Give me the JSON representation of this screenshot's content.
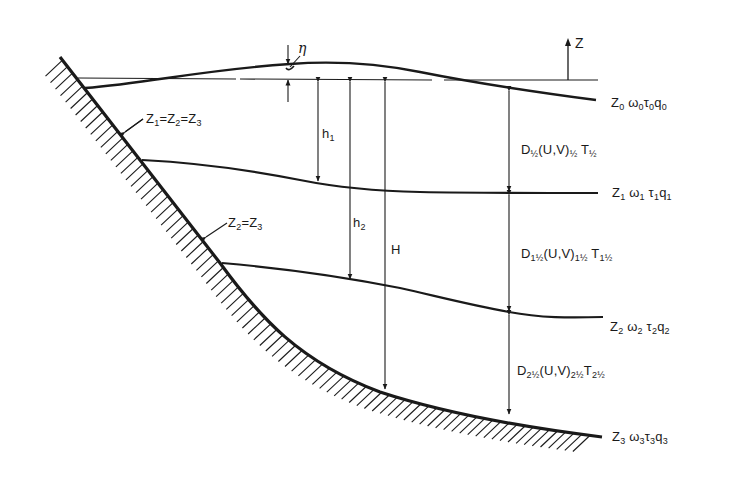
{
  "figure": {
    "colors": {
      "ink": "#1a1a1a",
      "background": "#ffffff"
    }
  },
  "labels": {
    "eta": "η",
    "z_axis": "Z",
    "bank_intersection_1": {
      "base": "Z",
      "parts": [
        [
          "Z",
          "1"
        ],
        [
          "Z",
          "2"
        ],
        [
          "Z",
          "3"
        ]
      ],
      "text": "Z1=Z2=Z3"
    },
    "bank_intersection_2": {
      "parts": [
        [
          "Z",
          "2"
        ],
        [
          "Z",
          "3"
        ]
      ],
      "text": "Z2=Z3"
    },
    "h1": {
      "base": "h",
      "sub": "1"
    },
    "h2": {
      "base": "h",
      "sub": "2"
    },
    "H": "H",
    "level_0": {
      "text": "Z0 ω0 τ0 q0",
      "parts": [
        [
          "Z",
          "0"
        ],
        [
          "ω",
          "0"
        ],
        [
          "τ",
          "0"
        ],
        [
          "q",
          "0"
        ]
      ]
    },
    "level_1": {
      "text": "Z1 ω1 τ1 q1",
      "parts": [
        [
          "Z",
          "1"
        ],
        [
          "ω",
          "1"
        ],
        [
          "τ",
          "1"
        ],
        [
          "q",
          "1"
        ]
      ]
    },
    "level_2": {
      "text": "Z2 ω2 τ2 q2",
      "parts": [
        [
          "Z",
          "2"
        ],
        [
          "ω",
          "2"
        ],
        [
          "τ",
          "2"
        ],
        [
          "q",
          "2"
        ]
      ]
    },
    "level_3": {
      "text": "Z3 ω3 τ3 q3",
      "parts": [
        [
          "Z",
          "3"
        ],
        [
          "ω",
          "3"
        ],
        [
          "τ",
          "3"
        ],
        [
          "q",
          "3"
        ]
      ]
    },
    "layer_half": {
      "text": "D½(U,V)½ T½",
      "D_sub": "½",
      "UV_sub": "½",
      "T_sub": "½"
    },
    "layer_1half": {
      "text": "D1½(U,V)1½ T1½",
      "D_sub": "1½",
      "UV_sub": "1½",
      "T_sub": "1½"
    },
    "layer_2half": {
      "text": "D2½(U,V)2½ T2½",
      "D_sub": "2½",
      "UV_sub": "2½",
      "T_sub": "2½"
    }
  },
  "geometry": {
    "mean_level_y": 79,
    "verticals_x": {
      "eta": 288,
      "h1": 318,
      "h2": 350,
      "H": 385,
      "D": 509
    },
    "z_arrow": {
      "x": 568,
      "y_from": 80,
      "y_to": 40
    }
  }
}
